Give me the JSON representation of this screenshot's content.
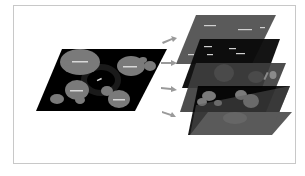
{
  "diagram": {
    "type": "layer-decomposition",
    "colors": {
      "background": "#ffffff",
      "frame_border": "#c8c8c8",
      "composite_plane": "#000000",
      "blob": "#7a7a7a",
      "halo": "#1a1a1a",
      "layer_grey": "#5a5a5a",
      "layer_dark": "#0a0a0a",
      "arrow": "#9a9a9a",
      "label_bar": "#d8d8d8"
    },
    "source_map": {
      "label": "composite-map"
    },
    "layers": [
      {
        "label": "layer-1-labels",
        "tone": "grey"
      },
      {
        "label": "layer-2-labels",
        "tone": "dark"
      },
      {
        "label": "layer-3-regions",
        "tone": "grey"
      },
      {
        "label": "layer-4-regions",
        "tone": "dark"
      },
      {
        "label": "layer-5-halo",
        "tone": "grey"
      }
    ],
    "arrows": 4
  }
}
